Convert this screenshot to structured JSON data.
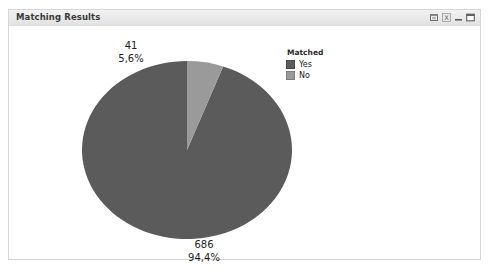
{
  "window": {
    "title": "Matching Results",
    "controls": [
      {
        "name": "restore-icon",
        "glyph": "restore"
      },
      {
        "name": "help-icon",
        "glyph": "help"
      },
      {
        "name": "minimize-icon",
        "glyph": "minimize"
      },
      {
        "name": "maximize-icon",
        "glyph": "maximize"
      }
    ]
  },
  "legend": {
    "title": "Matched",
    "items": [
      {
        "label": "Yes",
        "color": "#5b5b5b"
      },
      {
        "label": "No",
        "color": "#9a9a9a"
      }
    ]
  },
  "labels": {
    "no": {
      "value": "41",
      "percent": "5,6%"
    },
    "yes": {
      "value": "686",
      "percent": "94,4%"
    }
  },
  "chart_data": {
    "type": "pie",
    "title": "Matching Results",
    "legend_title": "Matched",
    "legend_position": "top-right",
    "categories": [
      "Yes",
      "No"
    ],
    "values": [
      686,
      41
    ],
    "percents": [
      94.4,
      5.6
    ],
    "value_labels": [
      "686",
      "41"
    ],
    "percent_labels": [
      "94,4%",
      "5,6%"
    ],
    "colors": [
      "#5b5b5b",
      "#9a9a9a"
    ],
    "total": 727,
    "start_angle_deg": 0,
    "direction": "counterclockwise",
    "geometry": {
      "cx": 178,
      "cy": 123,
      "rx": 105,
      "ry": 89
    },
    "xlabel": "",
    "ylabel": "",
    "grid": false
  }
}
